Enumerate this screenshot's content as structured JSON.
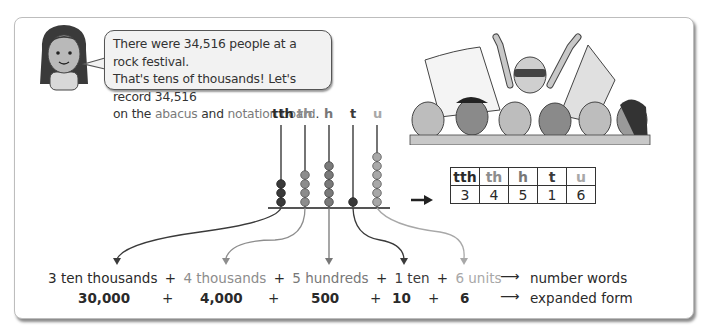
{
  "speech": {
    "line1": "There were 34,516 people at a rock festival.",
    "line2": "That's tens of thousands! Let's record 34,516",
    "line3_pre": "on the ",
    "line3_abacus": "abacus",
    "line3_mid": " and ",
    "line3_board": "notation board",
    "line3_post": "."
  },
  "abacus": {
    "labels": [
      "tth",
      "th",
      "h",
      "t",
      "u"
    ],
    "beads": [
      3,
      4,
      5,
      1,
      6
    ]
  },
  "notation_board": {
    "headers": [
      "tth",
      "th",
      "h",
      "t",
      "u"
    ],
    "digits": [
      "3",
      "4",
      "5",
      "1",
      "6"
    ]
  },
  "number_words": {
    "parts": [
      "3 ten thousands",
      "4 thousands",
      "5 hundreds",
      "1 ten",
      "6 units"
    ],
    "plus": "+",
    "arrow": "⟶",
    "label": "number words"
  },
  "expanded_form": {
    "parts": [
      "30,000",
      "4,000",
      "500",
      "10",
      "6"
    ],
    "plus": "+",
    "arrow": "⟶",
    "label": "expanded form"
  },
  "colors": {
    "tth": "#2a2a2a",
    "th": "#8d8d8d",
    "h": "#777777",
    "t": "#3a3a3a",
    "u": "#a8a8a8"
  }
}
